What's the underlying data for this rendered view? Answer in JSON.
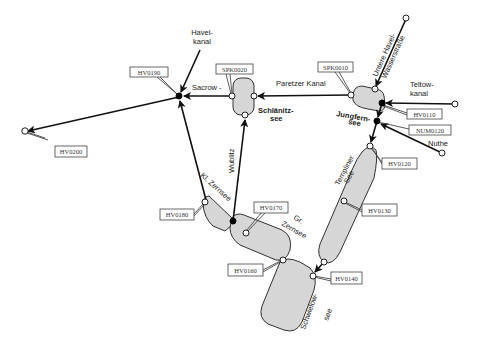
{
  "diagram": {
    "type": "waterway-network",
    "colors": {
      "lake_fill": "#d6d6d6",
      "line": "#111111",
      "background": "#ffffff"
    },
    "waterway_labels": {
      "havelkanal_1": "Havel-",
      "havelkanal_2": "kanal",
      "sacrow": "Sacrow -",
      "paretzer_kanal": "Paretzer Kanal",
      "untere_havel_1": "Untere Havel-",
      "untere_havel_2": "Wasserstraße",
      "teltowkanal_1": "Teltow-",
      "teltowkanal_2": "kanal",
      "nuthe": "Nuthe",
      "wublitz": "Wublitz"
    },
    "lake_labels": {
      "schlaenitz_1": "Schlänitz-",
      "schlaenitz_2": "see",
      "jungfern_1": "Jungfern-",
      "jungfern_2": "see",
      "templiner_1": "Templiner",
      "templiner_2": "See",
      "kl_zernsee": "Kl. Zernsee",
      "gr_zernsee_1": "Gr.",
      "gr_zernsee_2": "Zernsee",
      "schwielow_1": "Schwielow-",
      "schwielow_2": "see"
    },
    "stations": {
      "hv0200": "HV0200",
      "hv0190": "HV0190",
      "spk0020": "SPK0020",
      "spk0010": "SPK0010",
      "hv0110": "HV0110",
      "num0120": "NUM0120",
      "hv0120": "HV0120",
      "hv0130": "HV0130",
      "hv0140": "HV0140",
      "hv0160": "HV0160",
      "hv0170": "HV0170",
      "hv0180": "HV0180"
    }
  }
}
